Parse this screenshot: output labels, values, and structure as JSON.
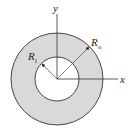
{
  "diagram": {
    "labels": {
      "x_axis": "x",
      "y_axis": "y",
      "inner_radius": "R",
      "inner_radius_sub": "i",
      "outer_radius": "R",
      "outer_radius_sub": "o"
    },
    "colors": {
      "ring_fill": "#d9d9d9",
      "stroke": "#333333",
      "hole_fill": "#ffffff"
    }
  }
}
